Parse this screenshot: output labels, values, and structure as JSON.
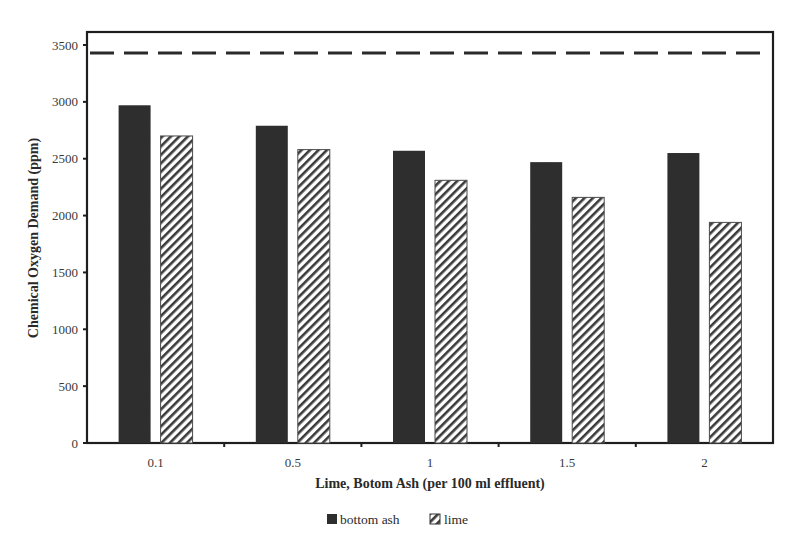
{
  "chart_data": {
    "type": "bar",
    "title": "",
    "xlabel": "Lime, Botom Ash (per 100 ml effluent)",
    "ylabel": "Chemical Oxygen Demand (ppm)",
    "categories": [
      "0.1",
      "0.5",
      "1",
      "1.5",
      "2"
    ],
    "series": [
      {
        "name": "bottom ash",
        "pattern": "solid",
        "color": "#2e2e2e",
        "values": [
          2970,
          2790,
          2570,
          2470,
          2550
        ]
      },
      {
        "name": "lime",
        "pattern": "diagonal-hatch",
        "color": "#3a3a3a",
        "values": [
          2700,
          2580,
          2310,
          2160,
          1940
        ]
      }
    ],
    "reference_line": {
      "style": "dashed",
      "value": 3430,
      "color": "#2a2a2a"
    },
    "ylim": [
      0,
      3500
    ],
    "yticks": [
      0,
      500,
      1000,
      1500,
      2000,
      2500,
      3000,
      3500
    ],
    "grid": false,
    "legend_position": "bottom-center"
  },
  "legend": {
    "items": [
      {
        "label": "bottom ash"
      },
      {
        "label": "lime"
      }
    ]
  }
}
